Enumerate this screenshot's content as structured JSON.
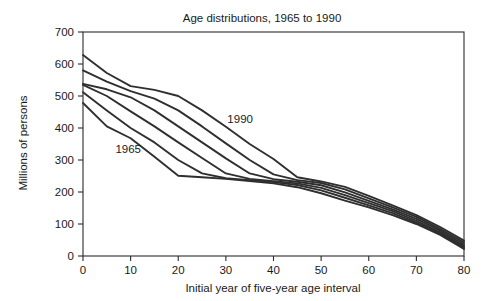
{
  "chart_data": {
    "type": "line",
    "title": "Age distributions, 1965 to 1990",
    "xlabel": "Initial year of five-year age interval",
    "ylabel": "Millions of persons",
    "xlim": [
      0,
      80
    ],
    "ylim": [
      0,
      700
    ],
    "xticks": [
      0,
      10,
      20,
      30,
      40,
      50,
      60,
      70,
      80
    ],
    "yticks": [
      0,
      100,
      200,
      300,
      400,
      500,
      600,
      700
    ],
    "grid": false,
    "legend": "none",
    "annotations": [
      {
        "text": "1990",
        "x": 33,
        "y": 415
      },
      {
        "text": "1965",
        "x": 9.5,
        "y": 322
      }
    ],
    "x": [
      0,
      5,
      10,
      15,
      20,
      25,
      30,
      35,
      40,
      45,
      50,
      55,
      60,
      65,
      70,
      75,
      80
    ],
    "series": [
      {
        "name": "1965",
        "values": [
          478,
          405,
          368,
          310,
          251,
          246,
          241,
          234,
          227,
          215,
          196,
          173,
          152,
          128,
          100,
          66,
          22
        ]
      },
      {
        "name": "1970",
        "values": [
          512,
          455,
          400,
          355,
          300,
          258,
          243,
          237,
          231,
          222,
          205,
          182,
          158,
          134,
          104,
          70,
          26
        ]
      },
      {
        "name": "1975",
        "values": [
          535,
          500,
          452,
          405,
          355,
          306,
          258,
          241,
          234,
          227,
          213,
          190,
          165,
          140,
          110,
          74,
          31
        ]
      },
      {
        "name": "1980",
        "values": [
          538,
          521,
          496,
          455,
          405,
          355,
          305,
          258,
          240,
          232,
          221,
          199,
          172,
          146,
          116,
          79,
          36
        ]
      },
      {
        "name": "1985",
        "values": [
          580,
          545,
          515,
          492,
          455,
          405,
          352,
          300,
          255,
          237,
          228,
          208,
          180,
          152,
          122,
          84,
          42
        ]
      },
      {
        "name": "1990",
        "values": [
          628,
          572,
          531,
          519,
          500,
          455,
          404,
          350,
          303,
          246,
          233,
          216,
          188,
          158,
          128,
          90,
          48
        ]
      }
    ]
  }
}
